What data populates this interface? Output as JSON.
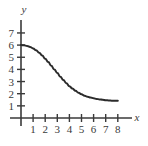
{
  "chart_data": {
    "type": "line",
    "title": "",
    "xlabel": "x",
    "ylabel": "y",
    "xlim": [
      -0.55,
      9.2
    ],
    "ylim": [
      -0.6,
      8.1
    ],
    "grid": false,
    "legend": null,
    "xticks": [
      1,
      2,
      3,
      4,
      5,
      6,
      7,
      8
    ],
    "yticks": [
      1,
      2,
      3,
      4,
      5,
      6,
      7
    ],
    "xtick_labels": [
      "1",
      "2",
      "3",
      "4",
      "5",
      "6",
      "7",
      "8"
    ],
    "ytick_labels": [
      "1",
      "2",
      "3",
      "4",
      "5",
      "6",
      "7"
    ],
    "series": [
      {
        "name": "curve",
        "color": "#2b2b2b",
        "linewidth": 2,
        "x": [
          0,
          0.25,
          0.5,
          0.75,
          1,
          1.25,
          1.5,
          1.75,
          2,
          2.25,
          2.5,
          2.75,
          3,
          3.25,
          3.5,
          3.75,
          4,
          4.25,
          4.5,
          4.75,
          5,
          5.25,
          5.5,
          5.75,
          6,
          6.25,
          6.5,
          6.75,
          7,
          7.25,
          7.5,
          7.75,
          8
        ],
        "y": [
          6.0,
          5.98,
          5.93,
          5.85,
          5.73,
          5.58,
          5.38,
          5.15,
          4.88,
          4.6,
          4.3,
          4.0,
          3.7,
          3.4,
          3.12,
          2.86,
          2.62,
          2.42,
          2.24,
          2.08,
          1.95,
          1.84,
          1.75,
          1.68,
          1.62,
          1.57,
          1.53,
          1.5,
          1.47,
          1.45,
          1.43,
          1.42,
          1.41
        ]
      }
    ]
  },
  "axes": {
    "x_axis_name": "x",
    "y_axis_name": "y"
  }
}
